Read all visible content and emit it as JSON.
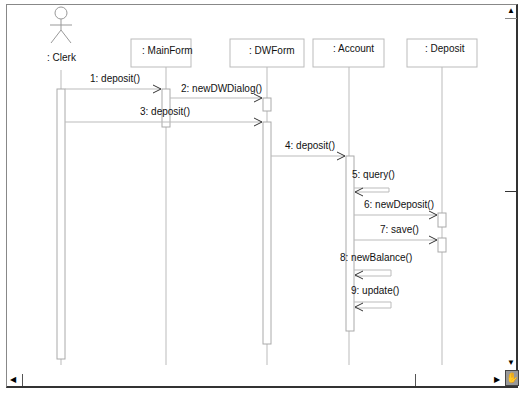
{
  "diagram": {
    "type": "UML sequence diagram",
    "actor": {
      "name": ": Clerk"
    },
    "lifelines": [
      {
        "id": "mainform",
        "label": ": MainForm"
      },
      {
        "id": "dwform",
        "label": ": DWForm"
      },
      {
        "id": "account",
        "label": ": Account"
      },
      {
        "id": "deposit",
        "label": ": Deposit"
      }
    ],
    "messages": [
      {
        "n": 1,
        "label": "1: deposit()",
        "from": "clerk",
        "to": "mainform"
      },
      {
        "n": 2,
        "label": "2: newDWDialog()",
        "from": "mainform",
        "to": "dwform"
      },
      {
        "n": 3,
        "label": "3: deposit()",
        "from": "clerk",
        "to": "dwform"
      },
      {
        "n": 4,
        "label": "4: deposit()",
        "from": "dwform",
        "to": "account"
      },
      {
        "n": 5,
        "label": "5: query()",
        "from": "account",
        "to": "account"
      },
      {
        "n": 6,
        "label": "6: newDeposit()",
        "from": "account",
        "to": "deposit"
      },
      {
        "n": 7,
        "label": "7: save()",
        "from": "account",
        "to": "deposit"
      },
      {
        "n": 8,
        "label": "8: newBalance()",
        "from": "account",
        "to": "account"
      },
      {
        "n": 9,
        "label": "9: update()",
        "from": "account",
        "to": "account"
      }
    ],
    "colors": {
      "line": "#999999",
      "arrow": "#333333",
      "text": "#111111",
      "frame": "#333333"
    }
  },
  "scrollbars": {
    "up_icon": "▲",
    "down_icon": "▼",
    "left_icon": "◀",
    "right_icon": "▶",
    "hand_icon": "✋"
  }
}
